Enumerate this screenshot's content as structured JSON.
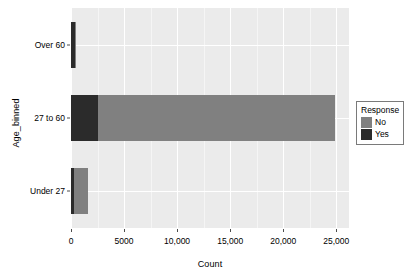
{
  "chart_data": {
    "type": "bar",
    "orientation": "horizontal",
    "stacked": true,
    "title": "",
    "xlabel": "Count",
    "ylabel": "Age_binned",
    "categories": [
      "Under 27",
      "27 to 60",
      "Over 60"
    ],
    "category_display_order_top_to_bottom": [
      "Over 60",
      "27 to 60",
      "Under 27"
    ],
    "series": [
      {
        "name": "Yes",
        "color": "#2b2b2b",
        "values": [
          280,
          2550,
          380
        ]
      },
      {
        "name": "No",
        "color": "#808080",
        "values": [
          1320,
          22350,
          90
        ]
      }
    ],
    "totals": [
      1600,
      24900,
      470
    ],
    "xlim": [
      0,
      26200
    ],
    "ylim": [
      0,
      3
    ],
    "x_ticks": [
      0,
      5000,
      10000,
      15000,
      20000,
      25000
    ],
    "x_tick_labels": [
      "0",
      "5000",
      "10,000",
      "15,000",
      "20,000",
      "25,000"
    ],
    "x_minor_ticks": [
      2500,
      7500,
      12500,
      17500,
      22500
    ],
    "grid": true,
    "grid_color": "#ffffff",
    "panel_background": "#ebebeb",
    "legend_position": "right"
  },
  "axes": {
    "y_title": "Age_binned",
    "x_title": "Count",
    "y_tick_labels": [
      "Over 60",
      "27 to 60",
      "Under 27"
    ],
    "x_tick_labels": [
      "0",
      "5000",
      "10,000",
      "15,000",
      "20,000",
      "25,000"
    ]
  },
  "legend": {
    "title": "Response",
    "items": [
      {
        "label": "No",
        "color": "#808080"
      },
      {
        "label": "Yes",
        "color": "#2b2b2b"
      }
    ]
  },
  "colors": {
    "panel": "#ebebeb",
    "grid_major": "#ffffff",
    "grid_minor": "#f5f5f5",
    "yes": "#2b2b2b",
    "no": "#808080",
    "text": "#000000",
    "legend_border": "#7a7a7a"
  }
}
